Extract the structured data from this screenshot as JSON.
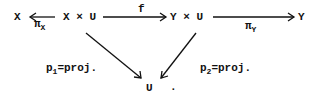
{
  "diagram": {
    "nodes": {
      "x": "X",
      "xu": "X × U",
      "yu": "Y × U",
      "y": "Y",
      "u": "U",
      "u_period": "."
    },
    "arrows": {
      "pi_x": {
        "symbol": "π",
        "sub": "X"
      },
      "f": {
        "label": "f"
      },
      "pi_y": {
        "symbol": "π",
        "sub": "Y"
      },
      "p1": {
        "base": "p",
        "sub": "1",
        "rest": "=proj."
      },
      "p2": {
        "base": "p",
        "sub": "2",
        "rest": "=proj."
      }
    }
  }
}
